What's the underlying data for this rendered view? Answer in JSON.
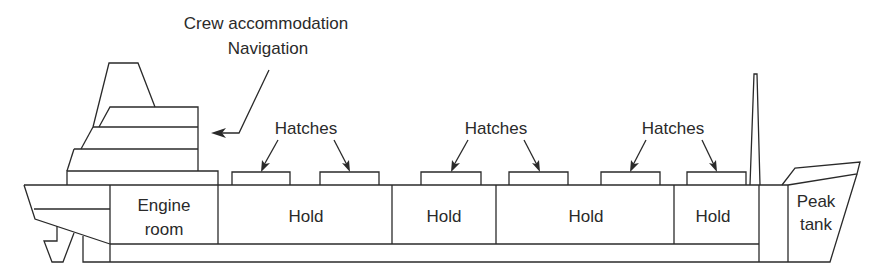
{
  "diagram": {
    "labels": {
      "crew_accommodation": "Crew accommodation",
      "navigation": "Navigation",
      "hatches_1": "Hatches",
      "hatches_2": "Hatches",
      "hatches_3": "Hatches"
    },
    "compartments": [
      {
        "name": "engine-room",
        "line1": "Engine",
        "line2": "room"
      },
      {
        "name": "hold-1",
        "label": "Hold"
      },
      {
        "name": "hold-2",
        "label": "Hold"
      },
      {
        "name": "hold-3",
        "label": "Hold"
      },
      {
        "name": "hold-4",
        "label": "Hold"
      },
      {
        "name": "peak-tank",
        "line1": "Peak",
        "line2": "tank"
      }
    ],
    "colors": {
      "line": "#2a2a2a",
      "background": "#ffffff"
    }
  }
}
